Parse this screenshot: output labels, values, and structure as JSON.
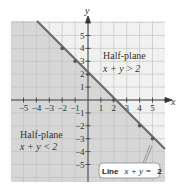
{
  "chart_data": {
    "type": "line",
    "title": "",
    "xlabel": "x",
    "ylabel": "y",
    "xlim": [
      -6,
      6
    ],
    "ylim": [
      -6,
      6
    ],
    "grid": true,
    "x_ticks": [
      -5,
      -4,
      -3,
      -2,
      -1,
      1,
      2,
      3,
      4,
      5
    ],
    "y_ticks": [
      -5,
      -4,
      -3,
      -2,
      -1,
      1,
      2,
      3,
      4,
      5
    ],
    "x_tick_labels": [
      "−5",
      "−4",
      "−3",
      "−2",
      "−1",
      "1",
      "2",
      "3",
      "4",
      "5"
    ],
    "y_tick_labels": [
      "−5",
      "−4",
      "−3",
      "−2",
      "−1",
      "1",
      "2",
      "3",
      "4",
      "5"
    ],
    "series": [
      {
        "name": "Line x + y = 2",
        "equation": "x + y = 2",
        "points": [
          [
            -2,
            4
          ],
          [
            -1,
            3
          ],
          [
            0,
            2
          ],
          [
            1,
            1
          ],
          [
            2,
            0
          ],
          [
            3,
            -1
          ],
          [
            4,
            -2
          ],
          [
            5,
            -3
          ]
        ],
        "marked_points": [
          [
            -2,
            4
          ],
          [
            -1,
            3
          ],
          [
            0,
            2
          ],
          [
            2,
            0
          ],
          [
            4,
            -2
          ],
          [
            5,
            -3
          ]
        ]
      }
    ],
    "regions": [
      {
        "name": "Half-plane",
        "inequality": "x + y > 2",
        "shaded": false
      },
      {
        "name": "Half-plane",
        "inequality": "x + y < 2",
        "shaded": true
      }
    ],
    "annotations": [
      {
        "text": "Line x + y = 2",
        "position": "bottom-right callout"
      }
    ]
  },
  "labels": {
    "x_axis": "x",
    "y_axis": "y",
    "upper_region_title": "Half-plane",
    "upper_region_ineq": "x + y > 2",
    "lower_region_title": "Half-plane",
    "lower_region_ineq": "x + y < 2",
    "callout_prefix": "Line",
    "callout_equation": "x + y =",
    "callout_value": "2"
  },
  "colors": {
    "shaded_region": "#d6d6d6",
    "unshaded_region": "#f1f1f1",
    "grid": "#bdbdbd",
    "line": "#6a6a6a",
    "axis": "#333333"
  }
}
